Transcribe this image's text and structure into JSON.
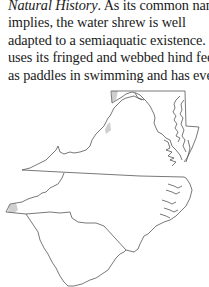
{
  "document": {
    "paragraph": {
      "lines": [
        {
          "italic_part": "Natural History",
          "rest": ". As its common name"
        },
        {
          "text": "implies, the water shrew is well"
        },
        {
          "text": "adapted to a semiaquatic existence. It"
        },
        {
          "text": "uses its fringed and webbed hind feet"
        },
        {
          "text": "as paddles in swimming and has even"
        }
      ]
    },
    "map": {
      "description": "Outline map of Maryland, Virginia, North Carolina and South Carolina showing water shrew range",
      "states": [
        "Maryland",
        "Virginia",
        "North Carolina",
        "South Carolina"
      ],
      "range_color": "#cfcfcf",
      "outline_color": "#555555"
    }
  }
}
